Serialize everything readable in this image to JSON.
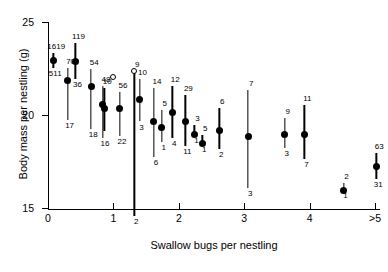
{
  "chart_data": {
    "type": "scatter",
    "title": "",
    "xlabel": "Swallow bugs per nestling",
    "ylabel": "Body mass per nestling (g)",
    "xtick_labels": [
      "0",
      "1",
      "2",
      "3",
      "4",
      ">5"
    ],
    "xtick_values": [
      0,
      1,
      2,
      3,
      4,
      5
    ],
    "ytick_labels": [
      "15",
      "20",
      "25"
    ],
    "ytick_values": [
      15,
      20,
      25
    ],
    "xlim": [
      -0.16,
      5.3
    ],
    "ylim": [
      14.3,
      25.0
    ],
    "grid": false,
    "legend": false,
    "error_bars": "vertical",
    "marker_note": "filled circles with vertical error bars; two small open circles",
    "points": [
      {
        "x": 0.08,
        "y": 22.95,
        "y_low": 22.55,
        "y_high": 23.35,
        "label_top": "1619",
        "label_bottom": "511",
        "open": false
      },
      {
        "x": 0.3,
        "y": 21.85,
        "y_low": 19.75,
        "y_high": 22.55,
        "label_top": "70",
        "label_bottom": "17",
        "open": false
      },
      {
        "x": 0.42,
        "y": 22.85,
        "y_low": 21.95,
        "y_high": 23.85,
        "label_top": "119",
        "label_bottom": "36",
        "open": false
      },
      {
        "x": 0.66,
        "y": 21.55,
        "y_low": 19.25,
        "y_high": 22.45,
        "label_top": "54",
        "label_bottom": "18",
        "open": false
      },
      {
        "x": 0.84,
        "y": 20.55,
        "y_low": 18.75,
        "y_high": 21.55,
        "label_top": "48",
        "label_bottom": "16",
        "open": false
      },
      {
        "x": 0.86,
        "y": 20.35,
        "y_low": 19.15,
        "y_high": 21.45,
        "label_top": "10",
        "label_bottom": "",
        "open": false
      },
      {
        "x": 1.0,
        "y": 22.05,
        "y_low": 22.05,
        "y_high": 22.05,
        "label_top": "",
        "label_bottom": "",
        "open": true
      },
      {
        "x": 1.1,
        "y": 20.35,
        "y_low": 18.85,
        "y_high": 21.25,
        "label_top": "56",
        "label_bottom": "22",
        "open": false
      },
      {
        "x": 1.32,
        "y": 22.35,
        "y_low": 14.55,
        "y_high": 22.35,
        "label_top": "9",
        "label_bottom": "2",
        "open": true
      },
      {
        "x": 1.4,
        "y": 20.85,
        "y_low": 19.65,
        "y_high": 21.95,
        "label_top": "10",
        "label_bottom": "3",
        "open": false
      },
      {
        "x": 1.62,
        "y": 19.65,
        "y_low": 17.75,
        "y_high": 21.45,
        "label_top": "14",
        "label_bottom": "6",
        "open": false
      },
      {
        "x": 1.74,
        "y": 19.35,
        "y_low": 18.55,
        "y_high": 20.25,
        "label_top": "5",
        "label_bottom": "1",
        "open": false
      },
      {
        "x": 1.9,
        "y": 20.15,
        "y_low": 18.75,
        "y_high": 21.55,
        "label_top": "12",
        "label_bottom": "4",
        "open": false
      },
      {
        "x": 2.1,
        "y": 19.65,
        "y_low": 18.35,
        "y_high": 21.05,
        "label_top": "29",
        "label_bottom": "11",
        "open": false
      },
      {
        "x": 2.24,
        "y": 18.95,
        "y_low": 18.95,
        "y_high": 19.45,
        "label_top": "3",
        "label_bottom": "1",
        "open": false
      },
      {
        "x": 2.36,
        "y": 18.45,
        "y_low": 18.45,
        "y_high": 18.95,
        "label_top": "5",
        "label_bottom": "1",
        "open": false
      },
      {
        "x": 2.62,
        "y": 19.15,
        "y_low": 18.15,
        "y_high": 20.35,
        "label_top": "6",
        "label_bottom": "2",
        "open": false
      },
      {
        "x": 3.06,
        "y": 18.85,
        "y_low": 16.05,
        "y_high": 21.35,
        "label_top": "7",
        "label_bottom": "3",
        "open": false
      },
      {
        "x": 3.62,
        "y": 18.95,
        "y_low": 18.25,
        "y_high": 19.85,
        "label_top": "9",
        "label_bottom": "3",
        "open": false
      },
      {
        "x": 3.92,
        "y": 18.95,
        "y_low": 17.65,
        "y_high": 20.55,
        "label_top": "11",
        "label_bottom": "7",
        "open": false
      },
      {
        "x": 4.52,
        "y": 15.95,
        "y_low": 15.95,
        "y_high": 16.35,
        "label_top": "2",
        "label_bottom": "1",
        "open": false
      },
      {
        "x": 5.02,
        "y": 17.25,
        "y_low": 16.55,
        "y_high": 17.95,
        "label_top": "63",
        "label_bottom": "31",
        "open": false
      }
    ]
  }
}
